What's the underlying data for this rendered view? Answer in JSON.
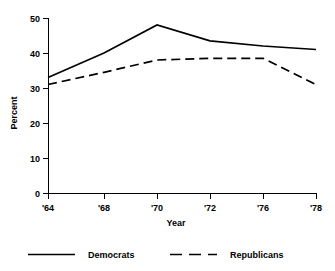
{
  "chart_data": {
    "type": "line",
    "title": "",
    "subtitle": "",
    "xlabel": "Year",
    "ylabel": "Percent",
    "grid": false,
    "legend_position": "bottom",
    "x": [
      1964,
      1968,
      1970,
      1972,
      1976,
      1978
    ],
    "xtick_labels": [
      "'64",
      "'68",
      "'70",
      "'72",
      "'76",
      "'78"
    ],
    "ytick_labels": [
      "0",
      "10",
      "20",
      "30",
      "40",
      "50"
    ],
    "ytick_values": [
      0,
      10,
      20,
      30,
      40,
      50
    ],
    "xlim": [
      1964,
      1978
    ],
    "ylim": [
      0,
      50
    ],
    "series": [
      {
        "name": "Democrats",
        "style": "solid",
        "color": "#000000",
        "values": [
          33,
          40,
          48,
          43.5,
          42,
          41
        ]
      },
      {
        "name": "Republicans",
        "style": "dashed",
        "color": "#000000",
        "values": [
          31,
          34.5,
          38,
          38.5,
          38.5,
          31
        ]
      }
    ]
  },
  "legend": {
    "entries": [
      {
        "label": "Democrats",
        "style": "solid"
      },
      {
        "label": "Republicans",
        "style": "dashed"
      }
    ]
  },
  "axes": {
    "y_title": "Percent",
    "x_title": "Year"
  }
}
